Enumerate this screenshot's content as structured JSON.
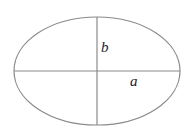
{
  "diagram": {
    "type": "ellipse-axes",
    "ellipse": {
      "cx": 97,
      "cy": 71,
      "rx": 83,
      "ry": 54,
      "stroke": "#8a8a8a"
    },
    "axes": {
      "stroke": "#8a8a8a"
    },
    "labels": {
      "semi_minor": "b",
      "semi_major": "a"
    }
  }
}
